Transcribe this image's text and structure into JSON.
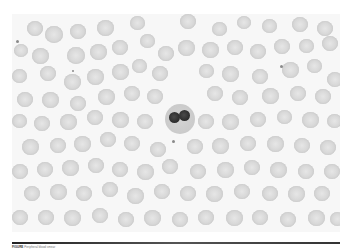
{
  "figure": {
    "caption_label": "FIGURE",
    "caption_text": "Peripheral blood smear"
  },
  "cells": {
    "wbc": {
      "x": 153,
      "y": 90,
      "d": 30
    },
    "lobes": [
      {
        "x": 157,
        "y": 98,
        "w": 11,
        "h": 11
      },
      {
        "x": 167,
        "y": 96,
        "w": 11,
        "h": 11
      }
    ],
    "platelets": [
      {
        "x": 4,
        "y": 26,
        "d": 3
      },
      {
        "x": 60,
        "y": 56,
        "d": 2
      },
      {
        "x": 160,
        "y": 126,
        "d": 3
      },
      {
        "x": 268,
        "y": 51,
        "d": 3
      },
      {
        "x": 331,
        "y": 189,
        "d": 2
      }
    ],
    "rbc": [
      [
        15,
        7,
        16
      ],
      [
        33,
        12,
        18
      ],
      [
        58,
        10,
        16
      ],
      [
        85,
        6,
        17
      ],
      [
        118,
        2,
        15
      ],
      [
        168,
        0,
        16
      ],
      [
        200,
        8,
        15
      ],
      [
        225,
        2,
        14
      ],
      [
        250,
        5,
        15
      ],
      [
        280,
        3,
        16
      ],
      [
        305,
        7,
        16
      ],
      [
        2,
        30,
        14
      ],
      [
        20,
        34,
        17
      ],
      [
        55,
        33,
        18
      ],
      [
        78,
        30,
        17
      ],
      [
        100,
        26,
        16
      ],
      [
        128,
        20,
        15
      ],
      [
        146,
        32,
        16
      ],
      [
        166,
        26,
        17
      ],
      [
        190,
        28,
        17
      ],
      [
        215,
        26,
        16
      ],
      [
        238,
        30,
        16
      ],
      [
        262,
        25,
        16
      ],
      [
        287,
        25,
        15
      ],
      [
        310,
        22,
        16
      ],
      [
        0,
        55,
        15
      ],
      [
        28,
        52,
        16
      ],
      [
        52,
        60,
        17
      ],
      [
        75,
        55,
        17
      ],
      [
        100,
        50,
        17
      ],
      [
        120,
        45,
        15
      ],
      [
        140,
        52,
        16
      ],
      [
        187,
        50,
        15
      ],
      [
        210,
        52,
        17
      ],
      [
        240,
        55,
        16
      ],
      [
        270,
        48,
        17
      ],
      [
        295,
        45,
        15
      ],
      [
        315,
        58,
        16
      ],
      [
        5,
        78,
        16
      ],
      [
        30,
        78,
        17
      ],
      [
        58,
        82,
        16
      ],
      [
        86,
        75,
        17
      ],
      [
        112,
        72,
        16
      ],
      [
        135,
        75,
        16
      ],
      [
        195,
        72,
        16
      ],
      [
        220,
        76,
        16
      ],
      [
        250,
        74,
        17
      ],
      [
        278,
        72,
        16
      ],
      [
        303,
        75,
        16
      ],
      [
        0,
        100,
        15
      ],
      [
        22,
        102,
        16
      ],
      [
        48,
        100,
        17
      ],
      [
        75,
        96,
        16
      ],
      [
        100,
        98,
        17
      ],
      [
        125,
        100,
        16
      ],
      [
        186,
        100,
        16
      ],
      [
        210,
        100,
        17
      ],
      [
        238,
        98,
        16
      ],
      [
        265,
        96,
        15
      ],
      [
        290,
        98,
        17
      ],
      [
        315,
        100,
        15
      ],
      [
        10,
        125,
        17
      ],
      [
        38,
        124,
        16
      ],
      [
        62,
        122,
        17
      ],
      [
        88,
        118,
        16
      ],
      [
        112,
        122,
        16
      ],
      [
        138,
        128,
        16
      ],
      [
        175,
        125,
        16
      ],
      [
        200,
        124,
        17
      ],
      [
        228,
        122,
        16
      ],
      [
        255,
        122,
        17
      ],
      [
        282,
        124,
        16
      ],
      [
        308,
        126,
        16
      ],
      [
        0,
        150,
        16
      ],
      [
        25,
        148,
        16
      ],
      [
        50,
        146,
        17
      ],
      [
        76,
        144,
        16
      ],
      [
        100,
        148,
        16
      ],
      [
        125,
        150,
        17
      ],
      [
        150,
        145,
        16
      ],
      [
        178,
        150,
        16
      ],
      [
        205,
        148,
        17
      ],
      [
        232,
        146,
        16
      ],
      [
        258,
        148,
        17
      ],
      [
        286,
        150,
        16
      ],
      [
        312,
        150,
        16
      ],
      [
        12,
        172,
        16
      ],
      [
        38,
        170,
        17
      ],
      [
        64,
        172,
        16
      ],
      [
        90,
        168,
        16
      ],
      [
        115,
        174,
        17
      ],
      [
        142,
        170,
        16
      ],
      [
        168,
        172,
        16
      ],
      [
        194,
        172,
        17
      ],
      [
        222,
        170,
        16
      ],
      [
        250,
        172,
        16
      ],
      [
        276,
        172,
        17
      ],
      [
        302,
        172,
        16
      ],
      [
        0,
        196,
        16
      ],
      [
        26,
        196,
        16
      ],
      [
        52,
        196,
        17
      ],
      [
        80,
        194,
        16
      ],
      [
        106,
        198,
        16
      ],
      [
        132,
        196,
        17
      ],
      [
        160,
        198,
        16
      ],
      [
        186,
        196,
        16
      ],
      [
        214,
        196,
        17
      ],
      [
        240,
        196,
        16
      ],
      [
        268,
        198,
        16
      ],
      [
        296,
        196,
        17
      ],
      [
        318,
        198,
        15
      ]
    ]
  }
}
